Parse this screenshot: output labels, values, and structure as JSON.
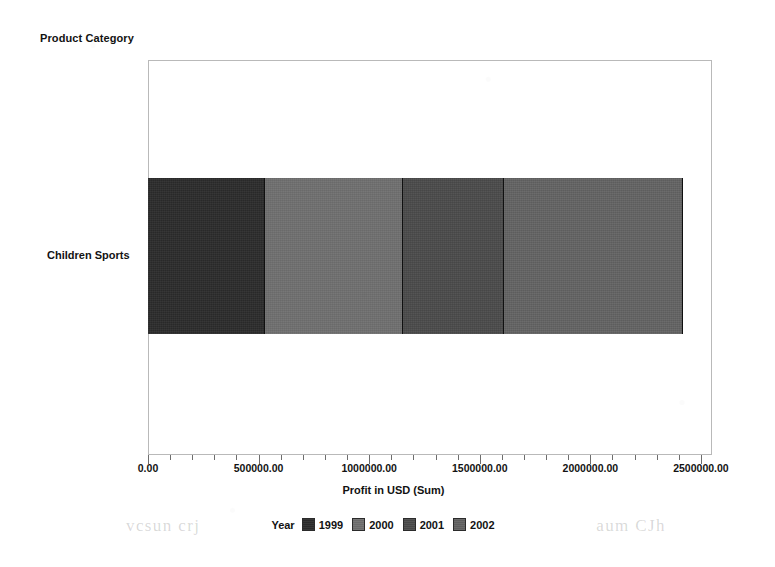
{
  "chart_data": {
    "type": "bar",
    "orientation": "horizontal",
    "stacked": true,
    "title": "",
    "xlabel": "Profit in USD (Sum)",
    "ylabel": "Product Category",
    "categories": [
      "Children Sports"
    ],
    "xlim": [
      0,
      2550000
    ],
    "xticks": [
      0,
      500000,
      1000000,
      1500000,
      2000000,
      2500000
    ],
    "xtick_labels": [
      "0.00",
      "500000.00",
      "1000000.00",
      "1500000.00",
      "2000000.00",
      "2500000.00"
    ],
    "minor_ticks_per_interval": 5,
    "grid": false,
    "legend_position": "bottom",
    "legend_title": "Year",
    "series": [
      {
        "name": "1999",
        "values": [
          530000
        ],
        "color": "#2b2b2b"
      },
      {
        "name": "2000",
        "values": [
          625000
        ],
        "color": "#6f6f6f"
      },
      {
        "name": "2001",
        "values": [
          455000
        ],
        "color": "#4a4a4a"
      },
      {
        "name": "2002",
        "values": [
          810000
        ],
        "color": "#626262"
      }
    ],
    "cumulative_boundaries": [
      530000,
      1155000,
      1610000,
      2420000
    ],
    "total": 2420000
  },
  "axes": {
    "y_axis_title": "Product Category",
    "x_axis_title": "Profit in USD (Sum)",
    "category_label": "Children Sports"
  },
  "legend": {
    "title": "Year",
    "items": [
      {
        "label": "1999",
        "color": "#2b2b2b"
      },
      {
        "label": "2000",
        "color": "#6f6f6f"
      },
      {
        "label": "2001",
        "color": "#4a4a4a"
      },
      {
        "label": "2002",
        "color": "#626262"
      }
    ]
  },
  "ticks": {
    "labels": [
      "0.00",
      "500000.00",
      "1000000.00",
      "1500000.00",
      "2000000.00",
      "2500000.00"
    ]
  },
  "artifacts": {
    "bleed_left": "vcsun crj",
    "bleed_right": "aum CJh"
  }
}
